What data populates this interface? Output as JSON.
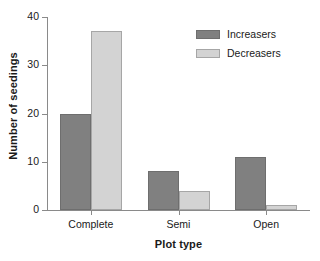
{
  "chart_data": {
    "type": "bar",
    "title": "",
    "subtitle": "",
    "xlabel": "Plot type",
    "ylabel": "Number of seedings",
    "categories": [
      "Complete",
      "Semi",
      "Open"
    ],
    "series": [
      {
        "name": "Increasers",
        "color": "#808080",
        "values": [
          20,
          8,
          11
        ]
      },
      {
        "name": "Decreasers",
        "color": "#d3d3d3",
        "values": [
          37,
          4,
          1
        ]
      }
    ],
    "ylim": [
      0,
      40
    ],
    "yticks": [
      0,
      10,
      20,
      30,
      40
    ],
    "ytick_labels": [
      "0",
      "10",
      "20",
      "30",
      "40"
    ],
    "grid": false,
    "legend_position": "top-right",
    "axis_color": "#8a8a8a",
    "background": "#ffffff"
  }
}
